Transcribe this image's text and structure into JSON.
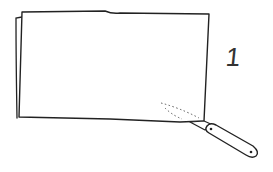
{
  "illustration": {
    "description": "Hand-drawn sketch of a folded sheet with a knife cutting along the bottom-right edge",
    "step_number": "1",
    "stroke_color": "#222222",
    "background_color": "#ffffff",
    "elements": [
      {
        "name": "folded-sheet",
        "type": "rectangle-sketch"
      },
      {
        "name": "sheet-back-edge",
        "type": "fold-edge"
      },
      {
        "name": "dotted-cut-lines",
        "type": "dotted-lines",
        "count": 2
      },
      {
        "name": "knife",
        "type": "tool",
        "parts": [
          "blade",
          "handle",
          "rivets"
        ]
      }
    ]
  }
}
